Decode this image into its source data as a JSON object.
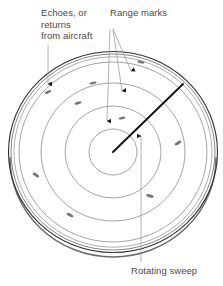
{
  "figure": {
    "background_color": "#ffffff"
  },
  "labels": {
    "echoes": "Echoes, or\nreturns\nfrom aircraft",
    "range_marks": "Range marks",
    "rotating_sweep": "Rotating sweep"
  },
  "colors": {
    "text": "#4a4a4a",
    "bezel_outer": "#2b2b2b",
    "bezel_inner": "#8a8a8a",
    "range_circle": "#8a8a8a",
    "sweep_line": "#111111",
    "leader_line": "#9a9a9a",
    "arrowhead": "#1a1a1a",
    "echo_blip": "#777777",
    "scope_face": "#ffffff"
  },
  "scope": {
    "center_x": 113,
    "center_y": 152,
    "bezel_outer_rx": 105,
    "bezel_outer_ry": 101,
    "bezel_inner_rx": 100,
    "bezel_inner_ry": 96,
    "range_rings": [
      {
        "name": "range-ring-1",
        "rx": 94,
        "ry": 90
      },
      {
        "name": "range-ring-2",
        "rx": 72,
        "ry": 69
      },
      {
        "name": "range-ring-3",
        "rx": 48,
        "ry": 46
      },
      {
        "name": "range-ring-4",
        "rx": 24,
        "ry": 23
      }
    ]
  },
  "sweep": {
    "name": "rotating-sweep",
    "from_x": 113,
    "from_y": 152,
    "to_x": 183,
    "to_y": 84,
    "stroke_width": 1.9
  },
  "echo_blips": [
    {
      "id": "blip-1",
      "cx": 48,
      "cy": 92,
      "rx": 3.4,
      "ry": 1.3,
      "angle": -28
    },
    {
      "id": "blip-2",
      "cx": 78,
      "cy": 103,
      "rx": 3.6,
      "ry": 1.4,
      "angle": -18
    },
    {
      "id": "blip-3",
      "cx": 93,
      "cy": 83,
      "rx": 3.6,
      "ry": 1.3,
      "angle": -12
    },
    {
      "id": "blip-4",
      "cx": 141,
      "cy": 62,
      "rx": 3.6,
      "ry": 1.4,
      "angle": 12
    },
    {
      "id": "blip-5",
      "cx": 178,
      "cy": 143,
      "rx": 3.8,
      "ry": 1.4,
      "angle": -32
    },
    {
      "id": "blip-6",
      "cx": 150,
      "cy": 196,
      "rx": 3.8,
      "ry": 1.5,
      "angle": 16
    },
    {
      "id": "blip-7",
      "cx": 70,
      "cy": 215,
      "rx": 3.8,
      "ry": 1.5,
      "angle": 28
    },
    {
      "id": "blip-8",
      "cx": 36,
      "cy": 175,
      "rx": 3.8,
      "ry": 1.5,
      "angle": 34
    },
    {
      "id": "blip-9",
      "cx": 122,
      "cy": 118,
      "rx": 3.4,
      "ry": 1.3,
      "angle": -14
    }
  ],
  "leaders": [
    {
      "id": "leader-echoes",
      "for": "echoes",
      "x1": 48,
      "y1": 45,
      "x2": 48,
      "y2": 84
    },
    {
      "id": "leader-range-1",
      "for": "range_marks",
      "x1": 113,
      "y1": 29,
      "x2": 131,
      "y2": 71
    },
    {
      "id": "leader-range-2",
      "for": "range_marks",
      "x1": 113,
      "y1": 29,
      "x2": 122,
      "y2": 91
    },
    {
      "id": "leader-range-3",
      "for": "range_marks",
      "x1": 110,
      "y1": 29,
      "x2": 107,
      "y2": 121
    },
    {
      "id": "leader-rotating-sweep",
      "for": "rotating_sweep",
      "x1": 141,
      "y1": 262,
      "x2": 141,
      "y2": 136
    }
  ]
}
